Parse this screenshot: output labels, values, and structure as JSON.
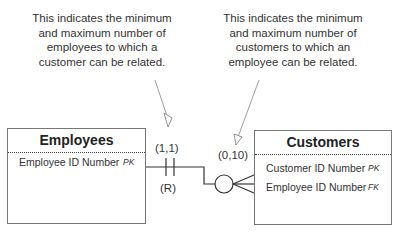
{
  "notes": {
    "left": "This indicates the minimum and maximum number of employees to which a customer can be related.",
    "right": "This indicates the minimum and maximum number of customers to which an employee can be related."
  },
  "entities": {
    "employees": {
      "title": "Employees",
      "attributes": [
        {
          "name": "Employee ID Number",
          "key": "PK"
        }
      ]
    },
    "customers": {
      "title": "Customers",
      "attributes": [
        {
          "name": "Customer ID Number",
          "key": "PK"
        },
        {
          "name": "Employee ID Number",
          "key": "FK"
        }
      ]
    }
  },
  "relationship": {
    "employee_side_cardinality": "(1,1)",
    "employee_side_marker": "(R)",
    "customer_side_cardinality": "(0,10)",
    "employee_side_symbol": "one-and-only-one",
    "customer_side_symbol": "zero-or-many"
  }
}
